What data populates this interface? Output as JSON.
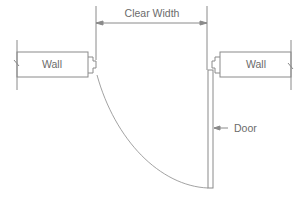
{
  "diagram": {
    "labels": {
      "clear_width": "Clear Width",
      "left_wall": "Wall",
      "right_wall": "Wall",
      "door": "Door"
    },
    "colors": {
      "line": "#8a8a8a",
      "text": "#6b6b6b",
      "background": "#ffffff"
    }
  }
}
